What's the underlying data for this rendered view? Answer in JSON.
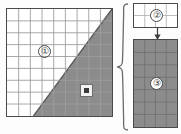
{
  "diagram": {
    "caption": "",
    "colors": {
      "shade_fill": "#8c8c8c",
      "grid_line": "#b9b9b9",
      "grid_line_dark": "#6f6f6f",
      "border": "#4a4a4a",
      "panel_background": "#ffffff",
      "marker_core": "#3a3a3a"
    },
    "panels": [
      {
        "id": "source",
        "name": "source-grid-panel",
        "columns": 9,
        "rows": 9,
        "fill": "#ffffff",
        "shaded_region": "lower-right triangle",
        "shaded_fill": "#8c8c8c",
        "badge": "①"
      },
      {
        "id": "tile",
        "name": "tile-grid-panel",
        "columns": 4,
        "rows": 2,
        "fill": "#ffffff",
        "badge": "②"
      },
      {
        "id": "result",
        "name": "result-grid-panel",
        "columns": 4,
        "rows": 7,
        "fill": "#8c8c8c",
        "badge": "③"
      }
    ],
    "badges": {
      "one": "①",
      "two": "②",
      "three": "③"
    },
    "marker": {
      "name": "selection-marker",
      "shape": "square-with-dot"
    },
    "connectors": {
      "brace": "{",
      "arrow": "↓"
    }
  }
}
